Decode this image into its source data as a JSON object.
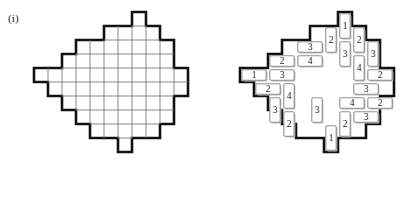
{
  "figure": {
    "label": "(i)",
    "cell_size": 14,
    "colors": {
      "outline": "#111111",
      "gridline": "#7a7a7a",
      "piece_stroke": "#8f8f8f",
      "piece_shadow": "#b9b9b9",
      "background": "#ffffff",
      "text": "#1a1a1a"
    },
    "panels": [
      {
        "name": "blank-board",
        "origin": {
          "x": 20,
          "y": 12
        },
        "cells": [
          {
            "col": 8,
            "row": 0
          },
          {
            "col": 6,
            "row": 1
          },
          {
            "col": 7,
            "row": 1
          },
          {
            "col": 8,
            "row": 1
          },
          {
            "col": 9,
            "row": 1
          },
          {
            "col": 4,
            "row": 2
          },
          {
            "col": 5,
            "row": 2
          },
          {
            "col": 6,
            "row": 2
          },
          {
            "col": 7,
            "row": 2
          },
          {
            "col": 8,
            "row": 2
          },
          {
            "col": 9,
            "row": 2
          },
          {
            "col": 10,
            "row": 2
          },
          {
            "col": 3,
            "row": 3
          },
          {
            "col": 4,
            "row": 3
          },
          {
            "col": 5,
            "row": 3
          },
          {
            "col": 6,
            "row": 3
          },
          {
            "col": 7,
            "row": 3
          },
          {
            "col": 8,
            "row": 3
          },
          {
            "col": 9,
            "row": 3
          },
          {
            "col": 10,
            "row": 3
          },
          {
            "col": 1,
            "row": 4
          },
          {
            "col": 2,
            "row": 4
          },
          {
            "col": 3,
            "row": 4
          },
          {
            "col": 4,
            "row": 4
          },
          {
            "col": 5,
            "row": 4
          },
          {
            "col": 6,
            "row": 4
          },
          {
            "col": 7,
            "row": 4
          },
          {
            "col": 8,
            "row": 4
          },
          {
            "col": 9,
            "row": 4
          },
          {
            "col": 10,
            "row": 4
          },
          {
            "col": 11,
            "row": 4
          },
          {
            "col": 2,
            "row": 5
          },
          {
            "col": 3,
            "row": 5
          },
          {
            "col": 4,
            "row": 5
          },
          {
            "col": 5,
            "row": 5
          },
          {
            "col": 6,
            "row": 5
          },
          {
            "col": 7,
            "row": 5
          },
          {
            "col": 8,
            "row": 5
          },
          {
            "col": 9,
            "row": 5
          },
          {
            "col": 10,
            "row": 5
          },
          {
            "col": 11,
            "row": 5
          },
          {
            "col": 3,
            "row": 6
          },
          {
            "col": 4,
            "row": 6
          },
          {
            "col": 5,
            "row": 6
          },
          {
            "col": 6,
            "row": 6
          },
          {
            "col": 7,
            "row": 6
          },
          {
            "col": 8,
            "row": 6
          },
          {
            "col": 9,
            "row": 6
          },
          {
            "col": 10,
            "row": 6
          },
          {
            "col": 4,
            "row": 7
          },
          {
            "col": 5,
            "row": 7
          },
          {
            "col": 6,
            "row": 7
          },
          {
            "col": 7,
            "row": 7
          },
          {
            "col": 8,
            "row": 7
          },
          {
            "col": 9,
            "row": 7
          },
          {
            "col": 10,
            "row": 7
          },
          {
            "col": 5,
            "row": 8
          },
          {
            "col": 6,
            "row": 8
          },
          {
            "col": 7,
            "row": 8
          },
          {
            "col": 8,
            "row": 8
          },
          {
            "col": 9,
            "row": 8
          },
          {
            "col": 7,
            "row": 9
          }
        ]
      },
      {
        "name": "tiled-board",
        "origin": {
          "x": 20,
          "y": 12
        },
        "cells": [
          {
            "col": 8,
            "row": 0
          },
          {
            "col": 6,
            "row": 1
          },
          {
            "col": 7,
            "row": 1
          },
          {
            "col": 8,
            "row": 1
          },
          {
            "col": 9,
            "row": 1
          },
          {
            "col": 4,
            "row": 2
          },
          {
            "col": 5,
            "row": 2
          },
          {
            "col": 6,
            "row": 2
          },
          {
            "col": 7,
            "row": 2
          },
          {
            "col": 8,
            "row": 2
          },
          {
            "col": 9,
            "row": 2
          },
          {
            "col": 10,
            "row": 2
          },
          {
            "col": 3,
            "row": 3
          },
          {
            "col": 4,
            "row": 3
          },
          {
            "col": 5,
            "row": 3
          },
          {
            "col": 6,
            "row": 3
          },
          {
            "col": 7,
            "row": 3
          },
          {
            "col": 8,
            "row": 3
          },
          {
            "col": 9,
            "row": 3
          },
          {
            "col": 10,
            "row": 3
          },
          {
            "col": 1,
            "row": 4
          },
          {
            "col": 2,
            "row": 4
          },
          {
            "col": 3,
            "row": 4
          },
          {
            "col": 4,
            "row": 4
          },
          {
            "col": 5,
            "row": 4
          },
          {
            "col": 6,
            "row": 4
          },
          {
            "col": 7,
            "row": 4
          },
          {
            "col": 8,
            "row": 4
          },
          {
            "col": 9,
            "row": 4
          },
          {
            "col": 10,
            "row": 4
          },
          {
            "col": 11,
            "row": 4
          },
          {
            "col": 2,
            "row": 5
          },
          {
            "col": 3,
            "row": 5
          },
          {
            "col": 4,
            "row": 5
          },
          {
            "col": 5,
            "row": 5
          },
          {
            "col": 6,
            "row": 5
          },
          {
            "col": 7,
            "row": 5
          },
          {
            "col": 8,
            "row": 5
          },
          {
            "col": 9,
            "row": 5
          },
          {
            "col": 10,
            "row": 5
          },
          {
            "col": 11,
            "row": 5
          },
          {
            "col": 3,
            "row": 6
          },
          {
            "col": 4,
            "row": 6
          },
          {
            "col": 5,
            "row": 6
          },
          {
            "col": 6,
            "row": 6
          },
          {
            "col": 7,
            "row": 6
          },
          {
            "col": 8,
            "row": 6
          },
          {
            "col": 9,
            "row": 6
          },
          {
            "col": 10,
            "row": 6
          },
          {
            "col": 4,
            "row": 7
          },
          {
            "col": 5,
            "row": 7
          },
          {
            "col": 6,
            "row": 7
          },
          {
            "col": 7,
            "row": 7
          },
          {
            "col": 8,
            "row": 7
          },
          {
            "col": 9,
            "row": 7
          },
          {
            "col": 10,
            "row": 7
          },
          {
            "col": 5,
            "row": 8
          },
          {
            "col": 6,
            "row": 8
          },
          {
            "col": 7,
            "row": 8
          },
          {
            "col": 8,
            "row": 8
          },
          {
            "col": 9,
            "row": 8
          },
          {
            "col": 7,
            "row": 9
          }
        ],
        "pieces": [
          {
            "id": "p-top-1",
            "label": "1",
            "col": 8,
            "row": 0,
            "orient": "v"
          },
          {
            "id": "p-r1-2a",
            "label": "2",
            "col": 7,
            "row": 1,
            "orient": "v"
          },
          {
            "id": "p-r1-2b",
            "label": "2",
            "col": 9,
            "row": 1,
            "orient": "v"
          },
          {
            "id": "p-r2-3a",
            "label": "3",
            "col": 5,
            "row": 2,
            "orient": "h"
          },
          {
            "id": "p-r2-3b",
            "label": "3",
            "col": 8,
            "row": 2,
            "orient": "v"
          },
          {
            "id": "p-r2-3c",
            "label": "3",
            "col": 10,
            "row": 2,
            "orient": "v"
          },
          {
            "id": "p-r3-2a",
            "label": "2",
            "col": 3,
            "row": 3,
            "orient": "h"
          },
          {
            "id": "p-r3-4a",
            "label": "4",
            "col": 5,
            "row": 3,
            "orient": "h"
          },
          {
            "id": "p-r3-4b",
            "label": "4",
            "col": 9,
            "row": 3,
            "orient": "v"
          },
          {
            "id": "p-r4-1a",
            "label": "1",
            "col": 1,
            "row": 4,
            "orient": "h"
          },
          {
            "id": "p-r4-3a",
            "label": "3",
            "col": 3,
            "row": 4,
            "orient": "h"
          },
          {
            "id": "p-r4-2b",
            "label": "2",
            "col": 10,
            "row": 4,
            "orient": "h"
          },
          {
            "id": "p-r5-2a",
            "label": "2",
            "col": 2,
            "row": 5,
            "orient": "h"
          },
          {
            "id": "p-r5-4a",
            "label": "4",
            "col": 4,
            "row": 5,
            "orient": "v"
          },
          {
            "id": "p-r5-3b",
            "label": "3",
            "col": 9,
            "row": 5,
            "orient": "h"
          },
          {
            "id": "p-r6-3a",
            "label": "3",
            "col": 3,
            "row": 6,
            "orient": "v"
          },
          {
            "id": "p-r6-3c",
            "label": "3",
            "col": 6,
            "row": 6,
            "orient": "v"
          },
          {
            "id": "p-r6-4c",
            "label": "4",
            "col": 8,
            "row": 6,
            "orient": "h"
          },
          {
            "id": "p-r6-2c",
            "label": "2",
            "col": 10,
            "row": 6,
            "orient": "h"
          },
          {
            "id": "p-r7-2a",
            "label": "2",
            "col": 4,
            "row": 7,
            "orient": "v"
          },
          {
            "id": "p-r7-2b",
            "label": "2",
            "col": 8,
            "row": 7,
            "orient": "v"
          },
          {
            "id": "p-r7-3d",
            "label": "3",
            "col": 9,
            "row": 7,
            "orient": "h"
          },
          {
            "id": "p-bot-1",
            "label": "1",
            "col": 7,
            "row": 8,
            "orient": "v"
          }
        ]
      }
    ]
  }
}
